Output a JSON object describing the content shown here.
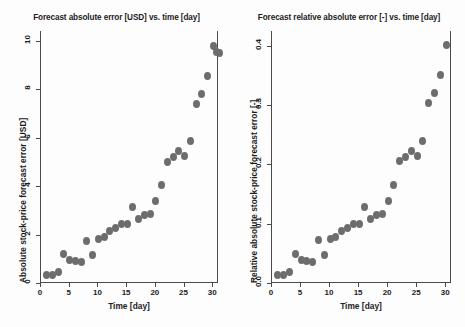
{
  "figure": {
    "background_color": "#fdfdfd",
    "marker_color": "#6d6d6d",
    "axis_color": "#4a4a4a"
  },
  "chart_data": [
    {
      "type": "scatter",
      "id": "absolute-error",
      "title": "Forecast absolute error [USD] vs. time [day]",
      "xlabel": "Time [day]",
      "ylabel": "Absolute stock-price forecast error [USD]",
      "xlim": [
        0,
        31
      ],
      "ylim": [
        0,
        10.4
      ],
      "xticks": [
        0,
        5,
        10,
        15,
        20,
        25,
        30
      ],
      "xtick_labels": [
        "0",
        "5",
        "10",
        "15",
        "20",
        "25",
        "30"
      ],
      "yticks": [
        0,
        2,
        4,
        6,
        8,
        10
      ],
      "ytick_labels": [
        "0",
        "2",
        "4",
        "6",
        "8",
        "10"
      ],
      "grid": false,
      "legend": "none",
      "x": [
        1,
        2,
        3,
        4,
        5,
        6,
        7,
        8,
        9,
        10,
        11,
        12,
        13,
        14,
        15,
        16,
        17,
        18,
        19,
        20,
        21,
        22,
        23,
        24,
        25,
        26,
        27,
        28,
        29,
        30
      ],
      "values": [
        0.35,
        0.35,
        0.45,
        1.2,
        0.95,
        0.9,
        0.85,
        1.75,
        1.15,
        1.8,
        1.9,
        2.15,
        2.25,
        2.45,
        2.45,
        3.15,
        2.65,
        2.8,
        2.85,
        3.4,
        4.05,
        5.0,
        5.2,
        5.45,
        5.25,
        5.85,
        7.4,
        7.8,
        8.55,
        9.8
      ],
      "values_tail": [
        9.55,
        9.5
      ]
    },
    {
      "type": "scatter",
      "id": "relative-error",
      "title": "Forecast relative absolute error [-] vs. time [day]",
      "xlabel": "Time [day]",
      "ylabel": "Relative absolute stock-price forecast error [-]",
      "xlim": [
        0,
        31
      ],
      "ylim": [
        0,
        0.425
      ],
      "xticks": [
        0,
        5,
        10,
        15,
        20,
        25,
        30
      ],
      "xtick_labels": [
        "0",
        "5",
        "10",
        "15",
        "20",
        "25",
        "30"
      ],
      "yticks": [
        0.0,
        0.1,
        0.2,
        0.3,
        0.4
      ],
      "ytick_labels": [
        "0.0",
        "0.1",
        "0.2",
        "0.3",
        "0.4"
      ],
      "grid": false,
      "legend": "none",
      "x": [
        1,
        2,
        3,
        4,
        5,
        6,
        7,
        8,
        9,
        10,
        11,
        12,
        13,
        14,
        15,
        16,
        17,
        18,
        19,
        20,
        21,
        22,
        23,
        24,
        25,
        26,
        27,
        28,
        29,
        30
      ],
      "values": [
        0.014,
        0.014,
        0.018,
        0.049,
        0.039,
        0.037,
        0.035,
        0.072,
        0.047,
        0.074,
        0.078,
        0.088,
        0.092,
        0.1,
        0.1,
        0.129,
        0.108,
        0.114,
        0.117,
        0.139,
        0.166,
        0.205,
        0.213,
        0.223,
        0.215,
        0.24,
        0.303,
        0.32,
        0.35,
        0.401
      ]
    }
  ]
}
